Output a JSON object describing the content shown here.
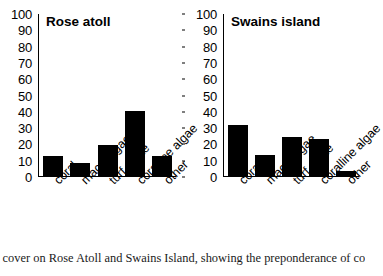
{
  "figure": {
    "caption": "c cover on Rose Atoll and Swains Island, showing the preponderance of coral"
  },
  "chart_data": [
    {
      "type": "bar",
      "title": "Rose atoll",
      "categories": [
        "coral",
        "macroalgae",
        "turf algae",
        "coralline algae",
        "other"
      ],
      "values": [
        12,
        8,
        19,
        40,
        12
      ],
      "xlabel": "",
      "ylabel": "",
      "ylim": [
        0,
        100
      ],
      "yticks": [
        0,
        10,
        20,
        30,
        40,
        50,
        60,
        70,
        80,
        90,
        100
      ],
      "grid": false,
      "legend": false,
      "bar_color": "#000000"
    },
    {
      "type": "bar",
      "title": "Swains island",
      "categories": [
        "coral",
        "macroalgae",
        "turf algae",
        "coralline algae",
        "other"
      ],
      "values": [
        31,
        13,
        24,
        23,
        3
      ],
      "xlabel": "",
      "ylabel": "",
      "ylim": [
        0,
        100
      ],
      "yticks": [
        0,
        10,
        20,
        30,
        40,
        50,
        60,
        70,
        80,
        90,
        100
      ],
      "grid": false,
      "legend": false,
      "bar_color": "#000000"
    }
  ]
}
